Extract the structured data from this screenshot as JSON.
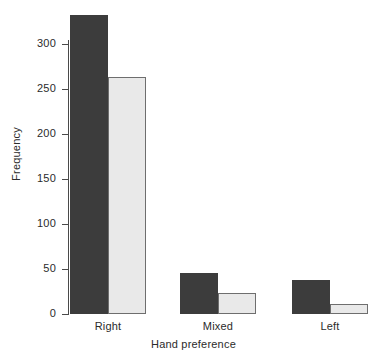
{
  "chart_data": {
    "type": "bar",
    "title": "",
    "xlabel": "Hand preference",
    "ylabel": "Frequency",
    "categories": [
      "Right",
      "Mixed",
      "Left"
    ],
    "series": [
      {
        "name": "series-1",
        "color": "#3c3c3c",
        "values": [
          332,
          46,
          38
        ]
      },
      {
        "name": "series-2",
        "color": "#e9e9e9",
        "values": [
          263,
          23,
          11
        ]
      }
    ],
    "ylim": [
      0,
      330
    ],
    "yticks": [
      0,
      50,
      100,
      150,
      200,
      250,
      300
    ],
    "ytick_labels": [
      "0",
      "50",
      "100",
      "150",
      "200",
      "250",
      "300"
    ],
    "grid": false,
    "legend": "none",
    "axis_color": "#4a4a4a"
  },
  "axis": {
    "y_title": "Frequency",
    "x_title": "Hand preference",
    "ticks": [
      {
        "label": "300",
        "value": 300
      },
      {
        "label": "250",
        "value": 250
      },
      {
        "label": "200",
        "value": 200
      },
      {
        "label": "150",
        "value": 150
      },
      {
        "label": "100",
        "value": 100
      },
      {
        "label": "50",
        "value": 50
      },
      {
        "label": "0",
        "value": 0
      }
    ]
  },
  "categories": [
    {
      "label": "Right"
    },
    {
      "label": "Mixed"
    },
    {
      "label": "Left"
    }
  ]
}
